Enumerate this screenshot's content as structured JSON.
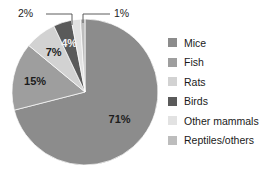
{
  "chart_data": {
    "type": "pie",
    "title": "",
    "categories": [
      "Mice",
      "Fish",
      "Rats",
      "Birds",
      "Other mammals",
      "Reptiles/others"
    ],
    "values": [
      71,
      15,
      7,
      4,
      2,
      1
    ],
    "value_labels": [
      "71%",
      "15%",
      "7%",
      "4%",
      "2%",
      "1%"
    ],
    "unit": "%",
    "legend_position": "right",
    "grid": false,
    "colors": [
      "#8c8c8c",
      "#9e9e9e",
      "#d2d2d2",
      "#5a5a5a",
      "#e2e2e2",
      "#bdbdbd"
    ],
    "label_placement": [
      "inside",
      "inside",
      "inside",
      "inside",
      "callout",
      "callout"
    ],
    "start_angle_deg": 0,
    "direction": "clockwise"
  },
  "legend": {
    "items": [
      {
        "label": "Mice",
        "color": "#8c8c8c"
      },
      {
        "label": "Fish",
        "color": "#9e9e9e"
      },
      {
        "label": "Rats",
        "color": "#d2d2d2"
      },
      {
        "label": "Birds",
        "color": "#5a5a5a"
      },
      {
        "label": "Other mammals",
        "color": "#e2e2e2"
      },
      {
        "label": "Reptiles/others",
        "color": "#bdbdbd"
      }
    ]
  },
  "labels": {
    "mice": "71%",
    "fish": "15%",
    "rats": "7%",
    "birds": "4%",
    "other_mammals": "2%",
    "reptiles_others": "1%"
  }
}
